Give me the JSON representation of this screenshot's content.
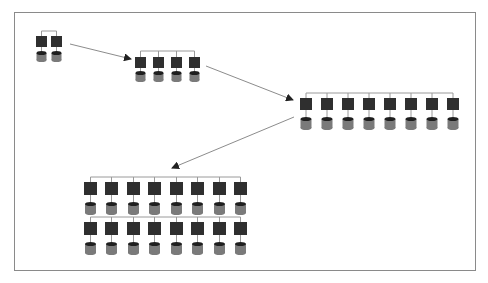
{
  "diagram": {
    "title": "",
    "colors": {
      "background": "#ffffff",
      "frame": "#8a8a8a",
      "server": "#2f2f2f",
      "database_body": "#7a7a7a",
      "database_cap": "#1e1e1e",
      "connector": "#9a9a9a",
      "arrow": "#8c8c8c",
      "arrowhead": "#222222"
    },
    "clusters": [
      {
        "id": "cluster-2",
        "node_count": 2,
        "rows": 1,
        "bus_y": 31,
        "server_y": 36,
        "server_w": 11,
        "server_h": 11,
        "db_y": 51,
        "db_w": 10,
        "db_h": 11,
        "xs": [
          36,
          51
        ]
      },
      {
        "id": "cluster-4",
        "node_count": 4,
        "rows": 1,
        "bus_y": 51,
        "server_y": 57,
        "server_w": 11,
        "server_h": 11,
        "db_y": 71,
        "db_w": 10,
        "db_h": 11,
        "xs": [
          135,
          153,
          171,
          189
        ]
      },
      {
        "id": "cluster-8",
        "node_count": 8,
        "rows": 1,
        "bus_y": 93,
        "server_y": 98,
        "server_w": 12,
        "server_h": 12,
        "db_y": 117,
        "db_w": 11,
        "db_h": 13,
        "xs": [
          300,
          321,
          342,
          363,
          384,
          405,
          426,
          447
        ]
      },
      {
        "id": "cluster-16",
        "node_count": 16,
        "rows": 2,
        "bus_y": 177,
        "server_y": 182,
        "server_w": 13,
        "server_h": 13,
        "db_y": 202,
        "db_w": 11,
        "db_h": 13,
        "row_gap": 40,
        "xs": [
          84,
          105,
          127,
          148,
          170,
          191,
          213,
          234
        ]
      }
    ],
    "arrows": [
      {
        "id": "arrow-2-to-4",
        "from": [
          70,
          44
        ],
        "to": [
          131,
          59
        ]
      },
      {
        "id": "arrow-4-to-8",
        "from": [
          206,
          66
        ],
        "to": [
          293,
          100
        ]
      },
      {
        "id": "arrow-8-to-16",
        "from": [
          294,
          117
        ],
        "to": [
          172,
          168
        ]
      }
    ]
  }
}
